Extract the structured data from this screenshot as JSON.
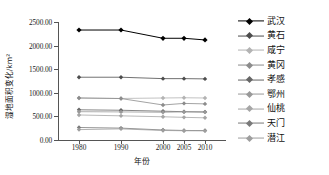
{
  "chart_data": {
    "type": "line",
    "title": "",
    "xlabel": "年份",
    "ylabel": "湿地面积变化/km²",
    "categories": [
      "1980",
      "1990",
      "2000",
      "2005",
      "2010"
    ],
    "x": [
      1980,
      1990,
      2000,
      2005,
      2010
    ],
    "xlim": [
      1975,
      2015
    ],
    "ylim": [
      0,
      2500
    ],
    "yticks": [
      "0.00",
      "500.00",
      "1000.00",
      "1500.00",
      "2000.00",
      "2500.00"
    ],
    "ytick_values": [
      0,
      500,
      1000,
      1500,
      2000,
      2500
    ],
    "grid": false,
    "legend_position": "right",
    "marker": "diamond",
    "series": [
      {
        "name": "武汉",
        "color": "#000000",
        "values": [
          2330,
          2330,
          2155,
          2155,
          2120
        ]
      },
      {
        "name": "黄石",
        "color": "#4d4d4d",
        "values": [
          1330,
          1330,
          1300,
          1300,
          1295
        ]
      },
      {
        "name": "咸宁",
        "color": "#b3b3b3",
        "values": [
          890,
          880,
          890,
          895,
          890
        ]
      },
      {
        "name": "黄冈",
        "color": "#8c8c8c",
        "values": [
          890,
          878,
          742,
          775,
          765
        ]
      },
      {
        "name": "孝感",
        "color": "#666666",
        "values": [
          640,
          630,
          610,
          600,
          595
        ]
      },
      {
        "name": "鄂州",
        "color": "#999999",
        "values": [
          600,
          595,
          588,
          596,
          590
        ]
      },
      {
        "name": "仙桃",
        "color": "#a6a6a6",
        "values": [
          530,
          512,
          492,
          480,
          470
        ]
      },
      {
        "name": "天门",
        "color": "#7a7a7a",
        "values": [
          265,
          252,
          212,
          202,
          200
        ]
      },
      {
        "name": "潜江",
        "color": "#9e9e9e",
        "values": [
          220,
          236,
          202,
          196,
          194
        ]
      }
    ]
  },
  "axis": {
    "y_title": "湿地面积变化/km²",
    "x_title": "年份"
  }
}
